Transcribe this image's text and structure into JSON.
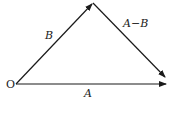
{
  "figure": {
    "origin_label": "O",
    "vectors": [
      {
        "id": "A",
        "label": "A",
        "from": "O",
        "to": "tip-A"
      },
      {
        "id": "B",
        "label": "B",
        "from": "O",
        "to": "tip-B"
      },
      {
        "id": "A-B",
        "label": "A−B",
        "from": "tip-B",
        "to": "tip-A"
      }
    ],
    "caption": "",
    "colors": {
      "line": "#1a1a1a",
      "background": "#ffffff"
    }
  }
}
